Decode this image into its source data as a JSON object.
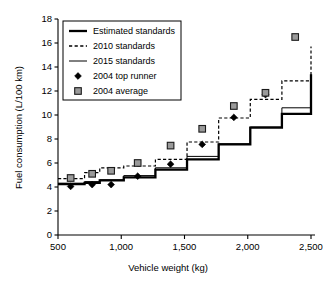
{
  "chart_data": {
    "type": "line",
    "title": "",
    "xlabel": "Vehicle weight (kg)",
    "ylabel": "Fuel consumption (L/100 km)",
    "xlim": [
      500,
      2500
    ],
    "ylim": [
      0,
      18
    ],
    "xticks": [
      500,
      1000,
      1500,
      2000,
      2500
    ],
    "xticklabels": [
      "500",
      "1,000",
      "1,500",
      "2,000",
      "2,500"
    ],
    "yticks": [
      0,
      2,
      4,
      6,
      8,
      10,
      12,
      14,
      16,
      18
    ],
    "yticklabels": [
      "0",
      "2",
      "4",
      "6",
      "8",
      "10",
      "12",
      "14",
      "16",
      "18"
    ],
    "grid": false,
    "legend_position": "upper left",
    "legend_entries": [
      {
        "label": "Estimated standards",
        "marker": "line-thick-solid",
        "color": "#000000"
      },
      {
        "label": "2010 standards",
        "marker": "line-dashed",
        "color": "#000000"
      },
      {
        "label": "2015 standards",
        "marker": "line-thin-solid",
        "color": "#000000"
      },
      {
        "label": "2004 top runner",
        "marker": "diamond-filled",
        "color": "#000000"
      },
      {
        "label": "2004 average",
        "marker": "square-grey",
        "color": "#9a9a9a"
      }
    ],
    "weight_class_edges": [
      500,
      710,
      830,
      1020,
      1270,
      1520,
      1770,
      2020,
      2270,
      2500
    ],
    "series": [
      {
        "name": "Estimated standards",
        "style": "step-post-thick-solid",
        "x": [
          500,
          710,
          830,
          1020,
          1270,
          1520,
          1770,
          2020,
          2270,
          2500
        ],
        "values": [
          4.25,
          4.35,
          4.55,
          4.8,
          5.45,
          6.3,
          7.55,
          8.95,
          10.1,
          13.4
        ]
      },
      {
        "name": "2010 standards",
        "style": "step-post-dashed",
        "x": [
          500,
          710,
          830,
          1020,
          1270,
          1520,
          1770,
          2020,
          2270,
          2500
        ],
        "values": [
          4.7,
          5.2,
          5.6,
          5.75,
          6.3,
          7.75,
          9.75,
          11.3,
          12.85,
          15.7
        ]
      },
      {
        "name": "2015 standards",
        "style": "step-post-thin-solid",
        "x": [
          500,
          710,
          830,
          1020,
          1270,
          1520,
          1770,
          2020,
          2270,
          2500
        ],
        "values": [
          4.3,
          4.45,
          4.6,
          4.95,
          5.6,
          6.55,
          7.6,
          9.0,
          10.6,
          11.6
        ]
      },
      {
        "name": "2004 top runner",
        "style": "scatter-diamond",
        "points": [
          {
            "x": 600,
            "y": 4.05
          },
          {
            "x": 770,
            "y": 4.2
          },
          {
            "x": 920,
            "y": 4.2
          },
          {
            "x": 1130,
            "y": 4.9
          },
          {
            "x": 1390,
            "y": 5.9
          },
          {
            "x": 1640,
            "y": 7.55
          },
          {
            "x": 1890,
            "y": 9.8
          },
          {
            "x": 2140,
            "y": 11.7
          }
        ]
      },
      {
        "name": "2004 average",
        "style": "scatter-square",
        "points": [
          {
            "x": 600,
            "y": 4.75
          },
          {
            "x": 770,
            "y": 5.1
          },
          {
            "x": 920,
            "y": 5.35
          },
          {
            "x": 1130,
            "y": 6.0
          },
          {
            "x": 1390,
            "y": 7.45
          },
          {
            "x": 1640,
            "y": 8.85
          },
          {
            "x": 1890,
            "y": 10.75
          },
          {
            "x": 2140,
            "y": 11.85
          },
          {
            "x": 2375,
            "y": 16.5
          }
        ]
      }
    ]
  }
}
